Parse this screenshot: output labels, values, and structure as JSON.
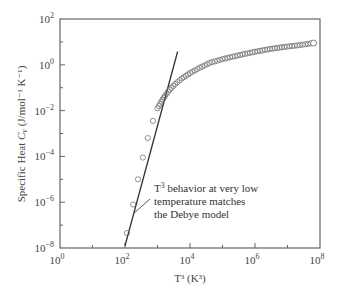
{
  "chart_data": {
    "type": "scatter",
    "title": "",
    "xlabel": "T³ (K³)",
    "ylabel": "Specific Heat C_v (J/mol⁻¹ K⁻¹)",
    "xscale": "log",
    "yscale": "log",
    "xlim": [
      1,
      100000000
    ],
    "ylim": [
      1e-08,
      100
    ],
    "x_tick_labels": [
      {
        "base": "10",
        "exp": "0"
      },
      {
        "base": "10",
        "exp": "2"
      },
      {
        "base": "10",
        "exp": "4"
      },
      {
        "base": "10",
        "exp": "6"
      },
      {
        "base": "10",
        "exp": "8"
      }
    ],
    "y_tick_labels": [
      {
        "base": "10",
        "exp": "2"
      },
      {
        "base": "10",
        "exp": "0"
      },
      {
        "base": "10",
        "exp": "−2"
      },
      {
        "base": "10",
        "exp": "−4"
      },
      {
        "base": "10",
        "exp": "−6"
      },
      {
        "base": "10",
        "exp": "−8"
      }
    ],
    "grid": false,
    "legend": null,
    "series": [
      {
        "name": "Measured C_v",
        "style": "open-circles",
        "log_x": [
          2.06,
          2.25,
          2.4,
          2.55,
          2.7,
          2.86,
          3.0,
          3.12,
          3.23,
          3.38,
          3.54,
          3.75,
          4.0,
          4.3,
          4.6,
          5.0,
          5.54,
          6.0,
          6.46,
          6.9,
          7.38,
          7.8
        ],
        "log_y": [
          -7.35,
          -6.1,
          -5.0,
          -4.05,
          -3.2,
          -2.45,
          -1.9,
          -1.6,
          -1.36,
          -1.08,
          -0.84,
          -0.6,
          -0.36,
          -0.13,
          0.08,
          0.25,
          0.43,
          0.57,
          0.69,
          0.78,
          0.86,
          0.95
        ]
      },
      {
        "name": "Debye T³ law fit",
        "style": "line",
        "log_x": [
          2.0,
          3.62
        ],
        "log_y": [
          -7.9,
          0.58
        ]
      }
    ],
    "annotations": [
      {
        "text_lines": [
          "T³ behavior at very low",
          "temperature matches",
          "the Debye model"
        ],
        "points_to": "Debye T³ line"
      }
    ]
  },
  "labels": {
    "xlabel": "T³ (K³)",
    "ylabel_prefix": "Specific Heat ",
    "ylabel_var": "C",
    "ylabel_sub": "v",
    "ylabel_units": " (J/mol⁻¹ K⁻¹)",
    "annotation_line1_pre": "T",
    "annotation_line1_sup": "3",
    "annotation_line1_post": " behavior at very low",
    "annotation_line2": "temperature matches",
    "annotation_line3": "the Debye model"
  },
  "colors": {
    "axis": "#555555",
    "line": "#333333",
    "marker_edge": "#666666",
    "marker_fill": "#ffffff"
  }
}
